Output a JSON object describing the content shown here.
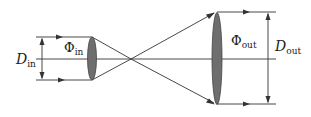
{
  "diagram": {
    "type": "beam-expander optical schematic",
    "labels": {
      "d_in": {
        "main": "D",
        "sub": "in"
      },
      "phi_in": {
        "main": "Φ",
        "sub": "in"
      },
      "phi_out": {
        "main": "Φ",
        "sub": "out"
      },
      "d_out": {
        "main": "D",
        "sub": "out"
      }
    },
    "colors": {
      "line": "#333333",
      "lens_fill": "#6e6e6e",
      "lens_stroke": "#444444",
      "background": "#ffffff"
    },
    "elements": [
      "input beam (two parallel rays)",
      "input lens (small)",
      "focal crossing point",
      "output lens (large)",
      "output beam (two parallel rays)",
      "input diameter dimension arrow",
      "output diameter dimension arrow",
      "optical axis"
    ]
  }
}
